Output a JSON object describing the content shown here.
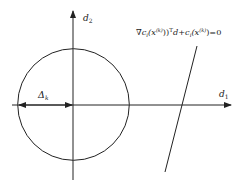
{
  "diagram": {
    "type": "trust-region-linearized-constraint",
    "axes": {
      "horizontal_label": "d",
      "horizontal_subscript": "1",
      "vertical_label": "d",
      "vertical_subscript": "2"
    },
    "radius_label": "Δ",
    "radius_subscript": "k",
    "constraint_equation": "∇c_i(x^(k))^T d + c_i(x^(k)) = 0",
    "equation_parts": {
      "nabla": "∇",
      "c1": "c",
      "i1": "i",
      "x1": "(x",
      "k1": "(k)",
      "close1": ")",
      "T": "T",
      "d": "d",
      "plus": "+",
      "c2": "c",
      "i2": "i",
      "x2": "(x",
      "k2": "(k)",
      "close2": ")",
      "eq": "=0"
    },
    "colors": {
      "stroke": "#222222",
      "background": "#ffffff"
    }
  }
}
